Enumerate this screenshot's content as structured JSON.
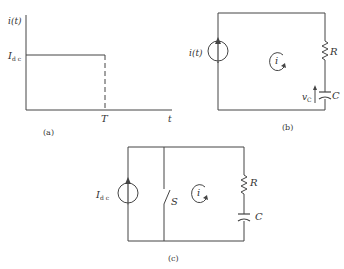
{
  "colors": {
    "ink": "#444444",
    "background": "#ffffff"
  },
  "panel_a": {
    "caption": "(a)",
    "y_axis_label": "i(t)",
    "level_label": "I",
    "level_subscript": "d c",
    "x_tick_label": "T",
    "x_axis_label": "t"
  },
  "panel_b": {
    "caption": "(b)",
    "source_label": "i(t)",
    "loop_current_label": "i",
    "resistor_label": "R",
    "capacitor_label": "C",
    "capacitor_voltage_label": "v",
    "capacitor_voltage_subscript": "C"
  },
  "panel_c": {
    "caption": "(c)",
    "source_label": "I",
    "source_subscript": "d c",
    "switch_label": "S",
    "loop_current_label": "i",
    "resistor_label": "R",
    "capacitor_label": "C"
  }
}
